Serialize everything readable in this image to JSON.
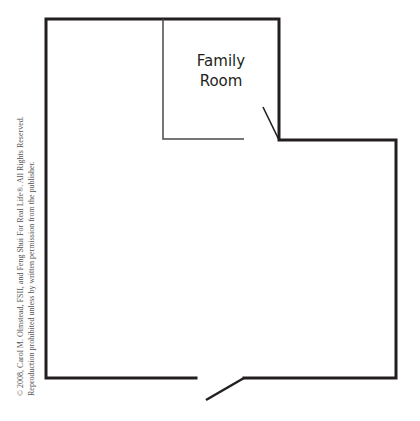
{
  "diagram": {
    "type": "floor-plan",
    "rooms": [
      {
        "label_lines": [
          "Family",
          "Room"
        ]
      }
    ],
    "walls": {
      "outer_path": "M196 378 L46 378 L46 19 L279 19 L279 140 L396 140 L396 378 L244 378",
      "inner_path": "M163 19 L163 139 L244 139"
    },
    "doors": [
      {
        "name": "family-room-door",
        "x1": 263,
        "y1": 107,
        "x2": 279,
        "y2": 140
      },
      {
        "name": "entry-door",
        "x1": 206,
        "y1": 400,
        "x2": 244,
        "y2": 378
      }
    ],
    "colors": {
      "wall": "#231f20",
      "inner_wall": "#4a4a4a",
      "text": "#231f20",
      "copyright_text": "#555555",
      "background": "#ffffff"
    }
  },
  "copyright": {
    "line1": "© 2008, Carol M. Olmstead, FSII, and Feng Shui For Real Life®. All Rights Reserved.",
    "line2": "Reproduction prohibited unless by written permission from the publisher."
  }
}
